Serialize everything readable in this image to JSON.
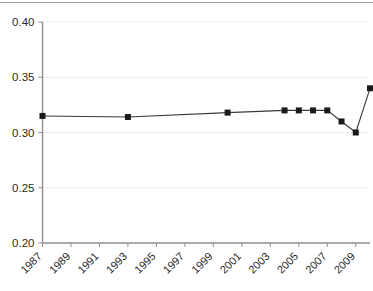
{
  "chart_data": {
    "type": "line",
    "title": "",
    "subtitle": "",
    "xlabel": "",
    "ylabel": "",
    "xlim": [
      1987,
      2010
    ],
    "ylim": [
      0.2,
      0.4
    ],
    "grid": true,
    "grid_axis": "y",
    "legend": false,
    "legend_position": "none",
    "marker": "square",
    "line_color": "#3a3a3a",
    "marker_color": "#1a1a1a",
    "y_ticks": [
      0.2,
      0.25,
      0.3,
      0.35,
      0.4
    ],
    "y_tick_labels": [
      "0.20",
      "0.25",
      "0.30",
      "0.35",
      "0.40"
    ],
    "x_ticks": [
      1987,
      1989,
      1991,
      1993,
      1995,
      1997,
      1999,
      2001,
      2003,
      2005,
      2007,
      2009
    ],
    "x_tick_labels": [
      "1987",
      "1989",
      "1991",
      "1993",
      "1995",
      "1997",
      "1999",
      "2001",
      "2003",
      "2005",
      "2007",
      "2009"
    ],
    "x_tick_rotation": -45,
    "series": [
      {
        "name": "series-1",
        "x": [
          1987,
          1993,
          2000,
          2004,
          2005,
          2006,
          2007,
          2008,
          2009,
          2010
        ],
        "values": [
          0.315,
          0.314,
          0.318,
          0.32,
          0.32,
          0.32,
          0.32,
          0.31,
          0.3,
          0.34
        ]
      }
    ]
  },
  "colors": {
    "axis": "#8f8f8f",
    "grid": "#cfcfcf",
    "text": "#2b2b2b",
    "line": "#3a3a3a",
    "marker": "#1a1a1a",
    "background": "#ffffff",
    "top_rule": "#9a9a9a"
  }
}
